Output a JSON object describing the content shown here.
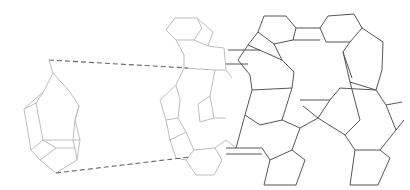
{
  "diagram": {
    "type": "framework-structure-illustration",
    "colors": {
      "background": "#ffffff",
      "light_framework": "#bdbdbd",
      "dark_framework": "#555555",
      "guide_lines": "#666666"
    },
    "isolated_unit": {
      "polylines": [
        [
          [
            49,
            60
          ],
          [
            53,
            73
          ],
          [
            44,
            91
          ],
          [
            24,
            109
          ],
          [
            31,
            150
          ],
          [
            40,
            160
          ],
          [
            56,
            173
          ],
          [
            77,
            160
          ],
          [
            80,
            140
          ],
          [
            75,
            120
          ],
          [
            79,
            106
          ],
          [
            70,
            92
          ],
          [
            53,
            73
          ]
        ],
        [
          [
            24,
            109
          ],
          [
            36,
            103
          ],
          [
            44,
            91
          ]
        ],
        [
          [
            36,
            103
          ],
          [
            43,
            140
          ],
          [
            31,
            150
          ]
        ],
        [
          [
            43,
            140
          ],
          [
            73,
            140
          ],
          [
            80,
            140
          ]
        ],
        [
          [
            40,
            160
          ],
          [
            56,
            148
          ],
          [
            75,
            148
          ],
          [
            77,
            160
          ]
        ],
        [
          [
            56,
            148
          ],
          [
            43,
            140
          ]
        ],
        [
          [
            75,
            148
          ],
          [
            73,
            140
          ]
        ],
        [
          [
            79,
            106
          ],
          [
            75,
            120
          ],
          [
            73,
            140
          ]
        ]
      ]
    },
    "guide_lines": [
      {
        "from": [
          49,
          60
        ],
        "to": [
          188,
          68
        ]
      },
      {
        "from": [
          56,
          173
        ],
        "to": [
          190,
          157
        ]
      }
    ],
    "light_framework": {
      "polylines": [
        [
          [
            166,
            30
          ],
          [
            175,
            18
          ],
          [
            197,
            18
          ],
          [
            202,
            28
          ],
          [
            194,
            40
          ],
          [
            176,
            40
          ],
          [
            166,
            30
          ]
        ],
        [
          [
            197,
            18
          ],
          [
            213,
            32
          ],
          [
            208,
            46
          ],
          [
            194,
            40
          ]
        ],
        [
          [
            176,
            40
          ],
          [
            184,
            55
          ],
          [
            184,
            68
          ]
        ],
        [
          [
            208,
            46
          ],
          [
            224,
            48
          ],
          [
            226,
            70
          ]
        ],
        [
          [
            184,
            68
          ],
          [
            176,
            85
          ],
          [
            180,
            100
          ],
          [
            178,
            118
          ],
          [
            186,
            132
          ]
        ],
        [
          [
            176,
            85
          ],
          [
            160,
            100
          ],
          [
            166,
            120
          ],
          [
            178,
            118
          ]
        ],
        [
          [
            166,
            120
          ],
          [
            170,
            140
          ],
          [
            186,
            132
          ]
        ],
        [
          [
            184,
            68
          ],
          [
            215,
            70
          ],
          [
            226,
            70
          ]
        ],
        [
          [
            186,
            132
          ],
          [
            194,
            150
          ],
          [
            186,
            160
          ],
          [
            196,
            175
          ],
          [
            214,
            175
          ],
          [
            222,
            160
          ],
          [
            215,
            148
          ]
        ],
        [
          [
            194,
            150
          ],
          [
            215,
            148
          ],
          [
            226,
            140
          ]
        ],
        [
          [
            170,
            140
          ],
          [
            176,
            158
          ],
          [
            186,
            160
          ]
        ],
        [
          [
            215,
            70
          ],
          [
            210,
            96
          ],
          [
            214,
            118
          ],
          [
            226,
            118
          ]
        ],
        [
          [
            210,
            96
          ],
          [
            198,
            104
          ],
          [
            200,
            122
          ],
          [
            214,
            118
          ]
        ],
        [
          [
            226,
            70
          ],
          [
            232,
            78
          ]
        ],
        [
          [
            226,
            140
          ],
          [
            236,
            148
          ]
        ]
      ]
    },
    "dark_framework": {
      "polylines": [
        [
          [
            264,
            16
          ],
          [
            286,
            16
          ],
          [
            296,
            28
          ],
          [
            293,
            40
          ],
          [
            274,
            44
          ],
          [
            258,
            32
          ],
          [
            264,
            16
          ]
        ],
        [
          [
            296,
            28
          ],
          [
            320,
            28
          ]
        ],
        [
          [
            293,
            40
          ],
          [
            320,
            40
          ]
        ],
        [
          [
            320,
            28
          ],
          [
            328,
            16
          ],
          [
            354,
            14
          ],
          [
            362,
            28
          ],
          [
            350,
            42
          ],
          [
            326,
            42
          ],
          [
            320,
            28
          ]
        ],
        [
          [
            362,
            28
          ],
          [
            383,
            42
          ],
          [
            382,
            70
          ],
          [
            376,
            90
          ],
          [
            350,
            82
          ]
        ],
        [
          [
            350,
            42
          ],
          [
            343,
            52
          ],
          [
            350,
            82
          ]
        ],
        [
          [
            343,
            52
          ],
          [
            352,
            78
          ]
        ],
        [
          [
            258,
            32
          ],
          [
            248,
            45
          ],
          [
            238,
            60
          ],
          [
            250,
            75
          ],
          [
            252,
            90
          ]
        ],
        [
          [
            274,
            44
          ],
          [
            282,
            60
          ],
          [
            294,
            72
          ],
          [
            292,
            88
          ]
        ],
        [
          [
            248,
            45
          ],
          [
            282,
            60
          ]
        ],
        [
          [
            252,
            90
          ],
          [
            292,
            88
          ]
        ],
        [
          [
            252,
            90
          ],
          [
            245,
            115
          ],
          [
            260,
            125
          ],
          [
            282,
            120
          ],
          [
            292,
            88
          ]
        ],
        [
          [
            245,
            115
          ],
          [
            236,
            148
          ]
        ],
        [
          [
            228,
            50
          ],
          [
            260,
            50
          ]
        ],
        [
          [
            226,
            64
          ],
          [
            248,
            64
          ]
        ],
        [
          [
            226,
            148
          ],
          [
            262,
            148
          ]
        ],
        [
          [
            226,
            154
          ],
          [
            262,
            154
          ]
        ],
        [
          [
            262,
            148
          ],
          [
            270,
            160
          ],
          [
            264,
            185
          ],
          [
            296,
            185
          ],
          [
            305,
            160
          ],
          [
            292,
            150
          ],
          [
            270,
            160
          ]
        ],
        [
          [
            292,
            150
          ],
          [
            300,
            128
          ],
          [
            318,
            118
          ],
          [
            330,
            100
          ]
        ],
        [
          [
            300,
            128
          ],
          [
            282,
            120
          ]
        ],
        [
          [
            318,
            118
          ],
          [
            345,
            135
          ],
          [
            360,
            120
          ],
          [
            350,
            82
          ]
        ],
        [
          [
            330,
            100
          ],
          [
            340,
            88
          ],
          [
            376,
            90
          ]
        ],
        [
          [
            345,
            135
          ],
          [
            355,
            150
          ],
          [
            380,
            150
          ],
          [
            396,
            130
          ],
          [
            386,
            105
          ],
          [
            376,
            90
          ]
        ],
        [
          [
            355,
            150
          ],
          [
            350,
            185
          ],
          [
            378,
            185
          ],
          [
            390,
            158
          ],
          [
            380,
            150
          ]
        ],
        [
          [
            396,
            130
          ],
          [
            404,
            120
          ]
        ],
        [
          [
            386,
            105
          ],
          [
            402,
            102
          ]
        ],
        [
          [
            300,
            100
          ],
          [
            330,
            100
          ]
        ],
        [
          [
            303,
            106
          ],
          [
            318,
            118
          ]
        ]
      ]
    }
  }
}
